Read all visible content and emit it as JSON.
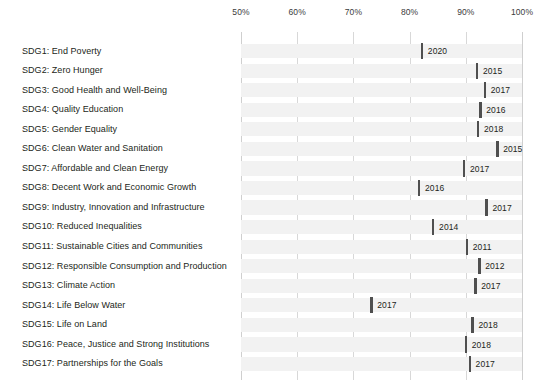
{
  "chart_data": {
    "type": "bar",
    "title": "",
    "subtitle": "",
    "xlabel": "",
    "ylabel": "",
    "xlim": [
      50,
      100
    ],
    "x_tick_labels": [
      "50%",
      "60%",
      "70%",
      "80%",
      "90%",
      "100%"
    ],
    "x_ticks": [
      50,
      60,
      70,
      80,
      90,
      100
    ],
    "grid": true,
    "legend": "none",
    "orientation": "horizontal",
    "value_label_key": "year",
    "categories": [
      "SDG1: End Poverty",
      "SDG2: Zero Hunger",
      "SDG3: Good Health and Well-Being",
      "SDG4: Quality Education",
      "SDG5: Gender Equality",
      "SDG6: Clean Water and Sanitation",
      "SDG7: Affordable and Clean Energy",
      "SDG8: Decent Work and Economic Growth",
      "SDG9: Industry, Innovation and Infrastructure",
      "SDG10: Reduced Inequalities",
      "SDG11: Sustainable Cities and Communities",
      "SDG12: Responsible Consumption and Production",
      "SDG13: Climate Action",
      "SDG14: Life Below Water",
      "SDG15: Life on Land",
      "SDG16: Peace, Justice and Strong Institutions",
      "SDG17: Partnerships for the Goals"
    ],
    "values": [
      82.0,
      91.8,
      93.2,
      92.4,
      92.0,
      95.4,
      89.5,
      81.5,
      93.5,
      84.0,
      90.0,
      92.2,
      91.5,
      73.0,
      91.0,
      89.8,
      90.5
    ],
    "labels": [
      "2020",
      "2015",
      "2017",
      "2016",
      "2018",
      "2015",
      "2017",
      "2016",
      "2017",
      "2014",
      "2011",
      "2012",
      "2017",
      "2017",
      "2018",
      "2018",
      "2017"
    ],
    "series": [
      {
        "name": "Coverage",
        "values": [
          82.0,
          91.8,
          93.2,
          92.4,
          92.0,
          95.4,
          89.5,
          81.5,
          93.5,
          84.0,
          90.0,
          92.2,
          91.5,
          73.0,
          91.0,
          89.8,
          90.5
        ]
      }
    ],
    "colors": {
      "bar_fill": "#f2f2f2",
      "marker": "#4f4f4f",
      "gridline": "#d8d8d8",
      "text": "#231f20",
      "background": "#ffffff"
    }
  }
}
